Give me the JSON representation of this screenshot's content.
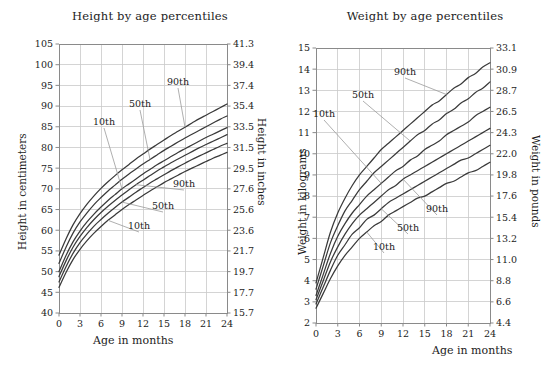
{
  "charts": [
    {
      "id": "height-chart",
      "title": "Height by age percentiles",
      "xlabel": "Age in months",
      "ylabel_left": "Height in centimeters",
      "ylabel_right": "Height in inches",
      "annotations_upper": [
        "10th",
        "50th",
        "90th"
      ],
      "annotations_lower": [
        "10th",
        "50th",
        "90th"
      ]
    },
    {
      "id": "weight-chart",
      "title": "Weight by age percentiles",
      "xlabel": "Age in months",
      "ylabel_left": "Weight in kilograms",
      "ylabel_right": "Weight in pounds",
      "annotations_upper": [
        "10th",
        "50th",
        "90th"
      ],
      "annotations_lower": [
        "10th",
        "50th",
        "90th"
      ]
    }
  ],
  "chart_data": [
    {
      "type": "line",
      "id": "height-chart",
      "title": "Height by age percentiles",
      "xlabel": "Age in months",
      "ylabel": "Height in centimeters",
      "ylabel_secondary": "Height in inches",
      "grid": true,
      "legend": "inline-annotations",
      "xlim": [
        0,
        24
      ],
      "ylim": [
        40,
        105
      ],
      "ylim_secondary": [
        15.7,
        41.3
      ],
      "xticks": [
        0,
        3,
        6,
        9,
        12,
        15,
        18,
        21,
        24
      ],
      "yticks": [
        40,
        45,
        50,
        55,
        60,
        65,
        70,
        75,
        80,
        85,
        90,
        95,
        100,
        105
      ],
      "yticks_secondary": [
        15.7,
        17.7,
        19.7,
        21.7,
        23.6,
        25.6,
        27.6,
        29.5,
        31.5,
        33.5,
        35.4,
        37.4,
        39.4,
        41.3
      ],
      "x": [
        0,
        1,
        2,
        3,
        4,
        5,
        6,
        7,
        8,
        9,
        10,
        11,
        12,
        13,
        14,
        15,
        16,
        17,
        18,
        19,
        20,
        21,
        22,
        23,
        24
      ],
      "series": [
        {
          "name": "90th (upper group)",
          "values": [
            54.0,
            57.9,
            61.3,
            64.0,
            66.3,
            68.3,
            70.1,
            71.7,
            73.2,
            74.6,
            75.9,
            77.2,
            78.4,
            79.6,
            80.7,
            81.8,
            82.9,
            83.9,
            84.9,
            85.9,
            86.9,
            87.8,
            88.7,
            89.6,
            90.5
          ]
        },
        {
          "name": "50th (upper group)",
          "values": [
            52.0,
            55.9,
            59.3,
            62.0,
            64.2,
            66.2,
            67.9,
            69.5,
            70.9,
            72.3,
            73.6,
            74.8,
            76.0,
            77.1,
            78.2,
            79.3,
            80.3,
            81.3,
            82.3,
            83.2,
            84.1,
            85.0,
            85.9,
            86.8,
            87.6
          ]
        },
        {
          "name": "10th (upper group)",
          "values": [
            50.0,
            53.9,
            57.2,
            59.8,
            62.0,
            63.9,
            65.6,
            67.2,
            68.6,
            70.0,
            71.2,
            72.4,
            73.6,
            74.7,
            75.8,
            76.8,
            77.8,
            78.8,
            79.7,
            80.6,
            81.5,
            82.4,
            83.2,
            84.0,
            84.8
          ]
        },
        {
          "name": "90th (lower group)",
          "values": [
            48.8,
            52.6,
            55.9,
            58.5,
            60.7,
            62.6,
            64.3,
            65.8,
            67.2,
            68.5,
            69.8,
            71.0,
            72.1,
            73.2,
            74.3,
            75.3,
            76.3,
            77.2,
            78.1,
            79.0,
            79.9,
            80.7,
            81.5,
            82.3,
            83.1
          ]
        },
        {
          "name": "50th (lower group)",
          "values": [
            47.5,
            51.2,
            54.4,
            57.0,
            59.1,
            61.0,
            62.6,
            64.1,
            65.5,
            66.8,
            68.0,
            69.2,
            70.3,
            71.4,
            72.4,
            73.4,
            74.4,
            75.3,
            76.2,
            77.1,
            77.9,
            78.7,
            79.5,
            80.3,
            81.0
          ]
        },
        {
          "name": "10th (lower group)",
          "values": [
            46.2,
            49.8,
            52.9,
            55.4,
            57.5,
            59.3,
            60.9,
            62.4,
            63.7,
            65.0,
            66.2,
            67.3,
            68.4,
            69.5,
            70.5,
            71.5,
            72.4,
            73.3,
            74.2,
            75.0,
            75.8,
            76.6,
            77.4,
            78.1,
            78.8
          ]
        }
      ],
      "annotations": [
        {
          "label": "10th",
          "points_to": "10th (upper group)"
        },
        {
          "label": "50th",
          "points_to": "50th (upper group)"
        },
        {
          "label": "90th",
          "points_to": "90th (upper group)"
        },
        {
          "label": "10th",
          "points_to": "10th (lower group)"
        },
        {
          "label": "50th",
          "points_to": "50th (lower group)"
        },
        {
          "label": "90th",
          "points_to": "90th (lower group)"
        }
      ]
    },
    {
      "type": "line",
      "id": "weight-chart",
      "title": "Weight by age percentiles",
      "xlabel": "Age in months",
      "ylabel": "Weight in kilograms",
      "ylabel_secondary": "Weight in pounds",
      "grid": true,
      "legend": "inline-annotations",
      "xlim": [
        0,
        24
      ],
      "ylim": [
        2,
        15
      ],
      "ylim_secondary": [
        4.4,
        33.1
      ],
      "xticks": [
        0,
        3,
        6,
        9,
        12,
        15,
        18,
        21,
        24
      ],
      "yticks": [
        2,
        3,
        4,
        5,
        6,
        7,
        8,
        9,
        10,
        11,
        12,
        13,
        14,
        15
      ],
      "yticks_secondary": [
        4.4,
        6.6,
        8.8,
        11.0,
        13.2,
        15.4,
        17.6,
        19.8,
        22.0,
        24.3,
        26.5,
        28.7,
        30.9,
        33.1
      ],
      "x": [
        0,
        1,
        2,
        3,
        4,
        5,
        6,
        7,
        8,
        9,
        10,
        11,
        12,
        13,
        14,
        15,
        16,
        17,
        18,
        19,
        20,
        21,
        22,
        23,
        24
      ],
      "series": [
        {
          "name": "90th (upper group)",
          "values": [
            3.9,
            5.1,
            6.3,
            7.2,
            7.9,
            8.5,
            9.0,
            9.4,
            9.8,
            10.2,
            10.5,
            10.8,
            11.1,
            11.4,
            11.7,
            12.0,
            12.3,
            12.5,
            12.8,
            13.1,
            13.3,
            13.6,
            13.8,
            14.1,
            14.3
          ]
        },
        {
          "name": "50th (upper group)",
          "values": [
            3.6,
            4.7,
            5.8,
            6.6,
            7.3,
            7.8,
            8.3,
            8.7,
            9.1,
            9.4,
            9.7,
            10.0,
            10.3,
            10.6,
            10.9,
            11.1,
            11.4,
            11.6,
            11.9,
            12.1,
            12.4,
            12.6,
            12.9,
            13.1,
            13.4
          ]
        },
        {
          "name": "10th (upper group)",
          "values": [
            3.3,
            4.3,
            5.3,
            6.1,
            6.7,
            7.2,
            7.6,
            8.0,
            8.3,
            8.6,
            8.9,
            9.2,
            9.4,
            9.7,
            9.9,
            10.2,
            10.4,
            10.6,
            10.9,
            11.1,
            11.3,
            11.5,
            11.8,
            12.0,
            12.2
          ]
        },
        {
          "name": "90th (lower group)",
          "values": [
            3.1,
            4.0,
            4.9,
            5.6,
            6.2,
            6.7,
            7.1,
            7.4,
            7.7,
            8.0,
            8.3,
            8.5,
            8.8,
            9.0,
            9.2,
            9.4,
            9.6,
            9.8,
            10.0,
            10.2,
            10.4,
            10.6,
            10.8,
            11.0,
            11.2
          ]
        },
        {
          "name": "50th (lower group)",
          "values": [
            2.9,
            3.7,
            4.5,
            5.2,
            5.7,
            6.2,
            6.5,
            6.9,
            7.1,
            7.4,
            7.7,
            7.9,
            8.1,
            8.3,
            8.5,
            8.7,
            8.9,
            9.1,
            9.3,
            9.5,
            9.7,
            9.8,
            10.0,
            10.2,
            10.4
          ]
        },
        {
          "name": "10th (lower group)",
          "values": [
            2.7,
            3.4,
            4.1,
            4.7,
            5.2,
            5.6,
            6.0,
            6.3,
            6.6,
            6.8,
            7.1,
            7.3,
            7.5,
            7.7,
            7.9,
            8.0,
            8.2,
            8.4,
            8.6,
            8.7,
            8.9,
            9.1,
            9.2,
            9.4,
            9.6
          ]
        }
      ],
      "annotations": [
        {
          "label": "10th",
          "points_to": "10th (upper group)"
        },
        {
          "label": "50th",
          "points_to": "50th (upper group)"
        },
        {
          "label": "90th",
          "points_to": "90th (upper group)"
        },
        {
          "label": "10th",
          "points_to": "10th (lower group)"
        },
        {
          "label": "50th",
          "points_to": "50th (lower group)"
        },
        {
          "label": "90th",
          "points_to": "90th (lower group)"
        }
      ]
    }
  ],
  "style": {
    "grid_color": "#c9c9c9",
    "axis_color": "#8a8a8a",
    "curve_color": "#3a3a3a",
    "leader_color": "#9a9a9a",
    "text_color": "#1c1c1c"
  }
}
